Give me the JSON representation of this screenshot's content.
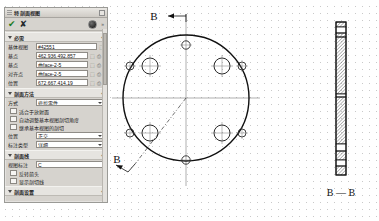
{
  "panel": {
    "title": "特 剖面视图",
    "toolbar": {
      "confirm_label": "✔",
      "cancel_label": "✘",
      "circle_icon": "filled-circle",
      "more_label": "»"
    },
    "sections": [
      {
        "name": "必需",
        "header": "必需",
        "expander": "+",
        "rows": [
          {
            "label": "基体视图",
            "value": "#42551",
            "type": "field",
            "suffix": [
              "pick"
            ]
          },
          {
            "label": "基点",
            "value": "462.936,492.857",
            "type": "field",
            "suffix": [
              "pick",
              "lock",
              "dots"
            ]
          },
          {
            "label": "基点",
            "value": "曲face-2-5",
            "type": "field",
            "suffix": [
              "pick",
              "lock",
              "dots"
            ]
          },
          {
            "label": "对齐点",
            "value": "曲face-2-5",
            "type": "field",
            "suffix": [
              "pick",
              "lock",
              "dots"
            ]
          },
          {
            "label": "位置",
            "value": "672.667,414.19",
            "type": "field",
            "suffix": [
              "pick",
              "lock",
              "dots"
            ]
          }
        ]
      },
      {
        "name": "剖面方法",
        "header": "剖面方法",
        "expander": "+",
        "rows": [
          {
            "label": "方式",
            "value": "修剪零件",
            "type": "dropdown"
          }
        ],
        "checkboxes": [
          {
            "label": "适合于放射面",
            "checked": false
          },
          {
            "label": "自动调整基本视图剖切角度",
            "checked": false
          },
          {
            "label": "继承基本视图的剖切",
            "checked": false
          }
        ],
        "rows2": [
          {
            "label": "位置",
            "value": "正交",
            "type": "dropdown"
          },
          {
            "label": "标注类型",
            "value": "详细",
            "type": "dropdown"
          }
        ]
      },
      {
        "name": "剖面线",
        "header": "剖面线",
        "expander": "+",
        "rows": [
          {
            "label": "视图标注",
            "value": "C",
            "type": "field"
          }
        ],
        "checkboxes": [
          {
            "label": "反转箭头",
            "checked": false
          },
          {
            "label": "显示剖切线",
            "checked": false
          }
        ]
      },
      {
        "name": "剖面设置",
        "header": "剖面设置",
        "expander": "+",
        "rows": [],
        "checkboxes": []
      }
    ]
  },
  "drawing": {
    "section_arrow_label_top": "B",
    "section_arrow_label_bottom": "B",
    "section_view_title": "B — B",
    "colors": {
      "outline": "#111111",
      "centerline": "#6b6b6b",
      "hatch": "#4a4a4a",
      "grid_dot": "#c9c9c9"
    },
    "front_view": {
      "shape": "circular-flange",
      "outer_radius_px": 63,
      "center": [
        78,
        98
      ],
      "large_holes": 4,
      "small_holes": 4,
      "axis_holes": 2
    },
    "section_view": {
      "shape": "thin-vertical-section",
      "hatched": true,
      "width_px": 10,
      "height_px": 140
    }
  }
}
